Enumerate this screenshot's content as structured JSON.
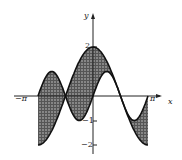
{
  "chart_data": {
    "type": "area",
    "title": "",
    "xlabel": "x",
    "ylabel": "y",
    "x_ticks": [
      "-π",
      "π"
    ],
    "y_ticks": [
      "2",
      "-1",
      "-2"
    ],
    "xlim": [
      -3.1416,
      3.1416
    ],
    "ylim": [
      -2,
      2
    ],
    "grid": false,
    "series": [
      {
        "name": "y = 2cos x",
        "x": [
          -3.1416,
          -2.3562,
          -1.5708,
          -0.7854,
          0,
          0.7854,
          1.5708,
          2.3562,
          3.1416
        ],
        "values": [
          -2,
          -1.414,
          0,
          1.414,
          2,
          1.414,
          0,
          -1.414,
          -2
        ]
      },
      {
        "name": "y = sin 2x",
        "x": [
          -3.1416,
          -2.3562,
          -1.5708,
          -0.7854,
          0,
          0.7854,
          1.5708,
          2.3562,
          3.1416
        ],
        "values": [
          0,
          1,
          0,
          -1,
          0,
          1,
          0,
          -1,
          0
        ]
      }
    ],
    "shaded_region": "between the two curves on [-π, π]"
  },
  "labels": {
    "x_axis": "x",
    "y_axis": "y",
    "neg_pi": "−π",
    "pos_pi": "π",
    "y2": "2",
    "ym1": "−1",
    "ym2": "−2"
  },
  "colors": {
    "ink": "#1a1a1a",
    "shade": "#3a3a3a"
  }
}
